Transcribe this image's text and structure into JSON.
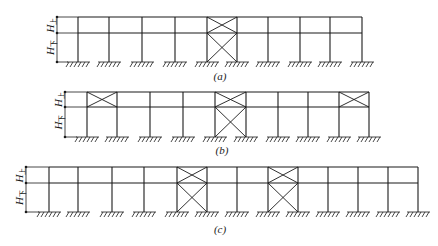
{
  "figure": {
    "stroke_color": "#1a1a1a",
    "background": "#ffffff",
    "panels": [
      {
        "id": "a",
        "caption": "(a)",
        "caption_pos": [
          220,
          80
        ],
        "y_top": 17,
        "y_mid": 33,
        "y_base": 62,
        "dim_x": 57,
        "columns": [
          78,
          109,
          142,
          175,
          207,
          237,
          268,
          300,
          330,
          362
        ],
        "braces": [
          {
            "from": 207,
            "to": 237,
            "levels": [
              "upper",
              "lower"
            ]
          }
        ],
        "labels": {
          "upper": "H",
          "upper_sub": "上",
          "lower": "H",
          "lower_sub": "下"
        }
      },
      {
        "id": "b",
        "caption": "(b)",
        "caption_pos": [
          222,
          154
        ],
        "y_top": 92,
        "y_mid": 107,
        "y_base": 137,
        "dim_x": 65,
        "columns": [
          87,
          117,
          150,
          183,
          215,
          246,
          278,
          308,
          339,
          369
        ],
        "braces": [
          {
            "from": 87,
            "to": 117,
            "levels": [
              "upper"
            ]
          },
          {
            "from": 215,
            "to": 246,
            "levels": [
              "upper",
              "lower"
            ]
          },
          {
            "from": 339,
            "to": 369,
            "levels": [
              "upper"
            ]
          }
        ],
        "labels": {
          "upper": "H",
          "upper_sub": "上",
          "lower": "H",
          "lower_sub": "下"
        }
      },
      {
        "id": "c",
        "caption": "(c)",
        "caption_pos": [
          220,
          233
        ],
        "y_top": 167,
        "y_mid": 183,
        "y_base": 212,
        "dim_x": 26,
        "columns": [
          49,
          78,
          112,
          144,
          177,
          207,
          237,
          268,
          298,
          328,
          358,
          388,
          418
        ],
        "braces": [
          {
            "from": 177,
            "to": 207,
            "levels": [
              "upper",
              "lower"
            ]
          },
          {
            "from": 268,
            "to": 298,
            "levels": [
              "upper",
              "lower"
            ]
          }
        ],
        "labels": {
          "upper": "H",
          "upper_sub": "上",
          "lower": "H",
          "lower_sub": "下"
        }
      }
    ]
  }
}
